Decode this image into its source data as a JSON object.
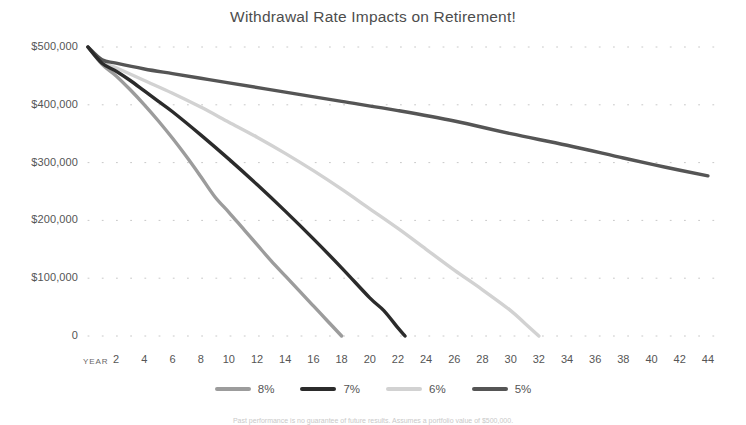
{
  "chart_data": {
    "type": "line",
    "title": "Withdrawal Rate Impacts on Retirement!",
    "xlabel": "YEAR",
    "ylabel": "",
    "xlim": [
      0,
      45
    ],
    "ylim": [
      0,
      500000
    ],
    "grid": "dotted",
    "legend_position": "bottom",
    "x_tick_labels": [
      "2",
      "4",
      "6",
      "8",
      "10",
      "12",
      "14",
      "16",
      "18",
      "20",
      "22",
      "24",
      "26",
      "28",
      "30",
      "32",
      "34",
      "36",
      "38",
      "40",
      "42",
      "44"
    ],
    "x_ticks": [
      2,
      4,
      6,
      8,
      10,
      12,
      14,
      16,
      18,
      20,
      22,
      24,
      26,
      28,
      30,
      32,
      34,
      36,
      38,
      40,
      42,
      44
    ],
    "y_tick_labels": [
      "$500,000",
      "$400,000",
      "$300,000",
      "$200,000",
      "$100,000",
      "0"
    ],
    "y_ticks": [
      500000,
      400000,
      300000,
      200000,
      100000,
      0
    ],
    "series": [
      {
        "name": "8%",
        "color": "#9c9c9c",
        "x": [
          0,
          1,
          2,
          3,
          4,
          5,
          6,
          7,
          8,
          9,
          10,
          11,
          12,
          13,
          14,
          15,
          16,
          17,
          18
        ],
        "values": [
          500000,
          470000,
          450000,
          426000,
          400000,
          372000,
          342000,
          310000,
          276000,
          241000,
          214000,
          186000,
          158000,
          130000,
          104000,
          78000,
          52000,
          26000,
          0
        ]
      },
      {
        "name": "7%",
        "color": "#2b2b2b",
        "x": [
          0,
          1,
          2,
          3,
          4,
          5,
          6,
          8,
          10,
          12,
          14,
          16,
          18,
          20,
          21,
          22,
          22.5
        ],
        "values": [
          500000,
          472000,
          458000,
          442000,
          424000,
          406000,
          388000,
          348000,
          306000,
          262000,
          216000,
          168000,
          118000,
          66000,
          44000,
          14000,
          0
        ]
      },
      {
        "name": "6%",
        "color": "#d2d2d2",
        "x": [
          0,
          1,
          2,
          4,
          6,
          8,
          10,
          12,
          14,
          16,
          18,
          20,
          22,
          24,
          26,
          28,
          30,
          31,
          32
        ],
        "values": [
          500000,
          474000,
          464000,
          442000,
          420000,
          396000,
          370000,
          344000,
          316000,
          286000,
          254000,
          220000,
          186000,
          150000,
          114000,
          80000,
          44000,
          22000,
          0
        ]
      },
      {
        "name": "5%",
        "color": "#555555",
        "x": [
          0,
          1,
          2,
          4,
          6,
          8,
          10,
          14,
          18,
          22,
          26,
          30,
          34,
          38,
          41,
          44
        ],
        "values": [
          500000,
          478000,
          472000,
          462000,
          454000,
          446000,
          438000,
          422000,
          406000,
          390000,
          372000,
          350000,
          330000,
          308000,
          292000,
          277000
        ]
      }
    ],
    "footnote": "Past performance is no guarantee of future results. Assumes a portfolio value of $500,000."
  }
}
